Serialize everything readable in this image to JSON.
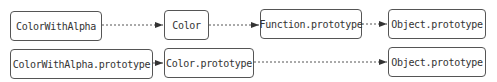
{
  "diagram": {
    "nodes": [
      {
        "id": "n1",
        "label": "ColorWithAlpha"
      },
      {
        "id": "n2",
        "label": "Color"
      },
      {
        "id": "n3",
        "label": "Function.prototype"
      },
      {
        "id": "n4",
        "label": "Object.prototype"
      },
      {
        "id": "n5",
        "label": "ColorWithAlpha.prototype"
      },
      {
        "id": "n6",
        "label": "Color.prototype"
      },
      {
        "id": "n7",
        "label": "Object.prototype"
      }
    ],
    "edges": [
      {
        "from": "ColorWithAlpha",
        "to": "Color",
        "style": "dotted"
      },
      {
        "from": "Color",
        "to": "Function.prototype",
        "style": "dotted"
      },
      {
        "from": "Function.prototype",
        "to": "Object.prototype",
        "style": "dotted"
      },
      {
        "from": "ColorWithAlpha.prototype",
        "to": "Color.prototype",
        "style": "dotted"
      },
      {
        "from": "Color.prototype",
        "to": "Object.prototype",
        "style": "dotted"
      }
    ]
  }
}
